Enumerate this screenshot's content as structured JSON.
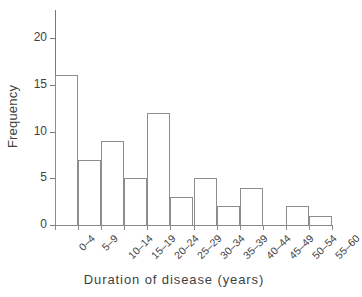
{
  "chart_data": {
    "type": "bar",
    "title": "",
    "subtitle": "",
    "xlabel": "Duration of disease (years)",
    "ylabel": "Frequency",
    "categories": [
      "0–4",
      "5–9",
      "10–14",
      "15–19",
      "20–24",
      "25–29",
      "30–34",
      "35–39",
      "40–44",
      "45–49",
      "50–54",
      "55–60"
    ],
    "values": [
      16,
      7,
      9,
      5,
      12,
      3,
      5,
      2,
      4,
      0,
      2,
      1
    ],
    "ylim": [
      0,
      23
    ],
    "yticks": [
      0,
      5,
      10,
      15,
      20
    ],
    "ytick_labels": [
      "0",
      "5",
      "10",
      "15",
      "20"
    ],
    "grid": false,
    "legend": null,
    "bar_style": {
      "fill": "#ffffff",
      "edge_color": "#8d8d8d",
      "edge_width": 1
    },
    "axis_color": "#7a7a7a",
    "text_color": "#3f3f3f",
    "background": "#ffffff",
    "xtick_label_rotation": -45
  }
}
